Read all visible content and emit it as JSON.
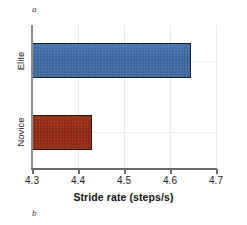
{
  "panels": {
    "top_label": "a",
    "bottom_label": "b"
  },
  "chart_data": {
    "type": "bar",
    "orientation": "horizontal",
    "title": "",
    "subtitle": "",
    "xlabel": "Stride rate (steps/s)",
    "ylabel": "",
    "categories": [
      "Elite",
      "Novice"
    ],
    "values": [
      4.645,
      4.43
    ],
    "xlim": [
      4.3,
      4.7
    ],
    "xticks": [
      4.3,
      4.4,
      4.5,
      4.6,
      4.7
    ],
    "xtick_labels": [
      "4.3",
      "4.4",
      "4.5",
      "4.6",
      "4.7"
    ],
    "grid": true,
    "legend": "none",
    "series": [
      {
        "name": "Elite",
        "value": 4.645,
        "color": "#4272ac",
        "edge_color": "#1b1b1b"
      },
      {
        "name": "Novice",
        "value": 4.43,
        "color": "#9c2d15",
        "edge_color": "#1b1b1b"
      }
    ],
    "annotations": []
  },
  "colors": {
    "elite_bar": "#4272ac",
    "novice_bar": "#9c2d15",
    "bar_edge": "#1b1b1b",
    "axis": "#6d6d6d",
    "grid": "#e8e8e8",
    "text": "#1d1d1d",
    "background": "#ffffff"
  }
}
